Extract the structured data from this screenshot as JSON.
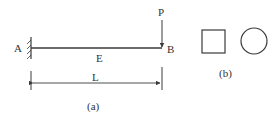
{
  "figure_a": {
    "support_label": "A",
    "tip_label": "B",
    "load_label": "P",
    "modulus_label": "E",
    "length_label": "L",
    "caption": "(a)"
  },
  "figure_b": {
    "cross_sections": [
      "square",
      "circle"
    ],
    "caption": "(b)"
  },
  "colors": {
    "stroke": "#3a3a3a",
    "text": "#333333"
  }
}
